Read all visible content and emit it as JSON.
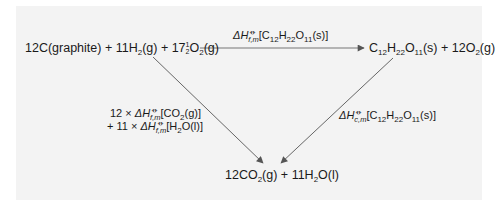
{
  "diagram": {
    "type": "thermochemical-cycle",
    "background": "#f3f3f3",
    "line_color": "#555555",
    "nodes": {
      "reactants": {
        "label": "12C(graphite) + 11H2(g) + 17½O2(g)",
        "parts": {
          "c": "12C(graphite) + 11H",
          "h2_sub": "2",
          "mid": "(g) + 17",
          "frac_num": "1",
          "frac_den": "2",
          "o": "O",
          "o2_sub": "2",
          "end": "(g)"
        }
      },
      "sucrose": {
        "label": "C12H22O11(s) + 12O2(g)",
        "parts": {
          "c": "C",
          "c_sub": "12",
          "h": "H",
          "h_sub": "22",
          "o": "O",
          "o_sub": "11",
          "mid": "(s) + 12O",
          "o2_sub": "2",
          "end": "(g)"
        }
      },
      "products": {
        "label": "12CO2(g) + 11H2O(l)",
        "parts": {
          "a": "12CO",
          "a_sub": "2",
          "mid": "(g) + 11H",
          "h_sub": "2",
          "end": "O(l)"
        }
      }
    },
    "edges": [
      {
        "from": "reactants",
        "to": "sucrose",
        "label": "ΔHf,m⦵[C12H22O11(s)]",
        "parts": {
          "delta": "ΔH",
          "sub": "f,m",
          "sup": "⦵",
          "open": "[C",
          "c_sub": "12",
          "h": "H",
          "h_sub": "22",
          "o": "O",
          "o_sub": "11",
          "close": "(s)]"
        }
      },
      {
        "from": "reactants",
        "to": "products",
        "label": "12 × ΔHf,m⦵[CO2(g)] + 11 × ΔHf,m⦵[H2O(l)]",
        "line1": {
          "pre": "12 × ",
          "delta": "ΔH",
          "sub": "f,m",
          "sup": "⦵",
          "open": "[CO",
          "co_sub": "2",
          "close": "(g)]"
        },
        "line2": {
          "pre": "+ 11 × ",
          "delta": "ΔH",
          "sub": "f,m",
          "sup": "⦵",
          "open": "[H",
          "h_sub": "2",
          "close": "O(l)]"
        }
      },
      {
        "from": "sucrose",
        "to": "products",
        "label": "ΔHc,m⦵[C12H22O11(s)]",
        "parts": {
          "delta": "ΔH",
          "sub": "c,m",
          "sup": "⦵",
          "open": "[C",
          "c_sub": "12",
          "h": "H",
          "h_sub": "22",
          "o": "O",
          "o_sub": "11",
          "close": "(s)]"
        }
      }
    ]
  }
}
